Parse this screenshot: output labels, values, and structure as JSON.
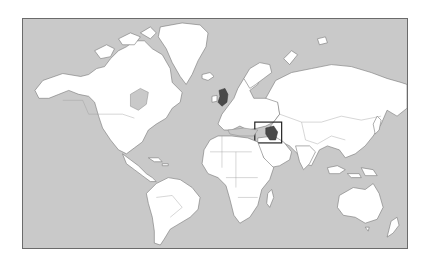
{
  "map": {
    "type": "world political outline map",
    "background_color": "#ffffff",
    "ocean_color": "#c9c9c9",
    "land_color": "#ffffff",
    "highlight_color": "#4a4a4a",
    "highlighted_regions": [
      "United Kingdom",
      "Iraq"
    ],
    "inset_box": {
      "region": "Iraq / Middle East",
      "stroke_color": "#222222"
    }
  }
}
